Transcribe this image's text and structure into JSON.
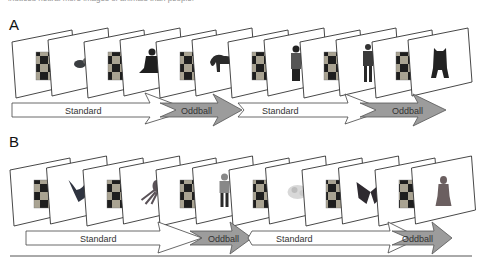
{
  "caption_fragment": "induced neural more images of animals than people.",
  "colors": {
    "card_border": "#333333",
    "card_fill": "#ffffff",
    "standard_arrow_fill": "#ffffff",
    "oddball_arrow_fill": "#9c9c9c",
    "checker_dark": "#1e1e1e",
    "checker_light": "#a9a392",
    "rule": "#555555"
  },
  "panels": [
    {
      "label": "A",
      "cards": [
        {
          "type": "checkerboard",
          "name": "checkerboard"
        },
        {
          "type": "image",
          "name": "small-animal"
        },
        {
          "type": "checkerboard",
          "name": "checkerboard"
        },
        {
          "type": "image",
          "name": "seated-person"
        },
        {
          "type": "checkerboard",
          "name": "checkerboard"
        },
        {
          "type": "image",
          "name": "lemur"
        },
        {
          "type": "checkerboard",
          "name": "checkerboard"
        },
        {
          "type": "image",
          "name": "woman-standing"
        },
        {
          "type": "checkerboard",
          "name": "checkerboard"
        },
        {
          "type": "image",
          "name": "man-standing"
        },
        {
          "type": "checkerboard",
          "name": "checkerboard"
        },
        {
          "type": "image",
          "name": "bear"
        }
      ],
      "arrows": [
        {
          "label": "Standard",
          "kind": "standard"
        },
        {
          "label": "Oddball",
          "kind": "oddball"
        },
        {
          "label": "Standard",
          "kind": "standard"
        },
        {
          "label": "Oddball",
          "kind": "oddball"
        }
      ]
    },
    {
      "label": "B",
      "cards": [
        {
          "type": "checkerboard",
          "name": "checkerboard"
        },
        {
          "type": "image",
          "name": "bird"
        },
        {
          "type": "checkerboard",
          "name": "checkerboard"
        },
        {
          "type": "image",
          "name": "octopus"
        },
        {
          "type": "checkerboard",
          "name": "checkerboard"
        },
        {
          "type": "image",
          "name": "child-standing"
        },
        {
          "type": "checkerboard",
          "name": "checkerboard"
        },
        {
          "type": "image",
          "name": "clownfish"
        },
        {
          "type": "checkerboard",
          "name": "checkerboard"
        },
        {
          "type": "image",
          "name": "butterfly"
        },
        {
          "type": "checkerboard",
          "name": "checkerboard"
        },
        {
          "type": "image",
          "name": "woman-figure"
        }
      ],
      "arrows": [
        {
          "label": "Standard",
          "kind": "standard"
        },
        {
          "label": "Oddball",
          "kind": "oddball"
        },
        {
          "label": "Standard",
          "kind": "standard"
        },
        {
          "label": "Oddball",
          "kind": "oddball"
        }
      ]
    }
  ]
}
